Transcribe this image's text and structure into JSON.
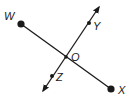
{
  "diagram": {
    "colors": {
      "stroke": "#1a1a1a",
      "background": "#ffffff"
    },
    "points": {
      "W": {
        "label": "W",
        "x": 21,
        "y": 24,
        "label_x": 4,
        "label_y": 20
      },
      "X": {
        "label": "X",
        "x": 111,
        "y": 89,
        "label_x": 118,
        "label_y": 94
      },
      "Y": {
        "label": "Y",
        "x": 89,
        "y": 23,
        "label_x": 93,
        "label_y": 30
      },
      "Z": {
        "label": "Z",
        "x": 52,
        "y": 76,
        "label_x": 56,
        "label_y": 81
      },
      "O": {
        "label": "O",
        "x": 66,
        "y": 57,
        "label_x": 71,
        "label_y": 61
      }
    },
    "segment_WX": {
      "from": "W",
      "to": "X",
      "type": "segment"
    },
    "line_YZ": {
      "through": [
        "Y",
        "Z"
      ],
      "type": "line",
      "arrow_top": {
        "x": 99,
        "y": 7
      },
      "arrow_bottom": {
        "x": 43,
        "y": 91
      }
    }
  }
}
